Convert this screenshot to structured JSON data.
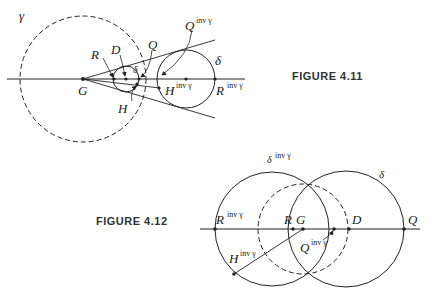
{
  "figure_4_11": {
    "caption": "FIGURE 4.11",
    "labels": {
      "gamma": "γ",
      "R": "R",
      "D": "D",
      "Q": "Q",
      "delta_small": "δ",
      "G": "G",
      "H": "H",
      "Q_inv": "Q",
      "Q_inv_sup": "inv γ",
      "delta": "δ",
      "H_inv": "H",
      "H_inv_sup": "inv γ",
      "R_inv": "R",
      "R_inv_sup": "inv γ"
    }
  },
  "figure_4_12": {
    "caption": "FIGURE 4.12",
    "labels": {
      "delta_inv": "δ",
      "delta_inv_sup": "inv γ",
      "delta": "δ",
      "R_inv": "R",
      "R_inv_sup": "inv γ",
      "R": "R",
      "G": "G",
      "D": "D",
      "Q": "Q",
      "Q_inv": "Q",
      "Q_inv_sup": "inv γ",
      "H_inv": "H",
      "H_inv_sup": "inv γ"
    }
  }
}
